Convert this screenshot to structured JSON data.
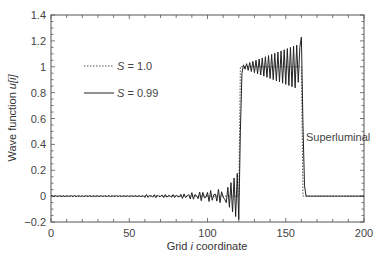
{
  "chart_data": {
    "type": "line",
    "title": "",
    "xlabel": "Grid i coordinate",
    "ylabel": "Wave function u[i]",
    "xlim": [
      0,
      200
    ],
    "ylim": [
      -0.2,
      1.4
    ],
    "xticks": [
      0,
      50,
      100,
      150,
      200
    ],
    "yticks": [
      -0.2,
      0,
      0.2,
      0.4,
      0.6,
      0.8,
      1,
      1.2,
      1.4
    ],
    "grid": false,
    "legend_position": "upper-left",
    "annotations": [
      {
        "text": "Superluminal",
        "x": 176,
        "y": 0.6
      }
    ],
    "series": [
      {
        "name": "S = 1.0",
        "style": "dotted",
        "x": [
          0,
          120,
          121,
          160,
          161,
          200
        ],
        "values": [
          0,
          0,
          1,
          1,
          0,
          0
        ]
      },
      {
        "name": "S = 0.99",
        "style": "solid",
        "x": [
          0,
          80,
          85,
          90,
          95,
          100,
          105,
          110,
          115,
          118,
          120,
          121,
          123,
          125,
          130,
          135,
          140,
          145,
          150,
          155,
          158,
          160,
          161,
          162,
          163,
          200
        ],
        "values": [
          0,
          0.0,
          0.03,
          -0.03,
          0.04,
          -0.04,
          0.05,
          -0.06,
          0.08,
          0.12,
          -0.18,
          0.5,
          0.98,
          1.0,
          1.02,
          0.98,
          1.03,
          0.96,
          1.05,
          0.93,
          1.1,
          1.23,
          0.6,
          0.1,
          0.0,
          0.0
        ]
      }
    ]
  },
  "legend": {
    "items": [
      {
        "symbol": "S",
        "text": " = 1.0"
      },
      {
        "symbol": "S",
        "text": " = 0.99"
      }
    ]
  },
  "axes": {
    "x_ticks": [
      "0",
      "50",
      "100",
      "150",
      "200"
    ],
    "y_ticks": [
      "1.4",
      "1.2",
      "1",
      "0.8",
      "0.6",
      "0.4",
      "0.2",
      "0",
      "−0.2"
    ],
    "xlabel_pre": "Grid ",
    "xlabel_var": "i",
    "xlabel_post": " coordinate",
    "ylabel_pre": "Wave function ",
    "ylabel_var": "u[i]"
  },
  "annotation": {
    "text": "Superluminal"
  }
}
